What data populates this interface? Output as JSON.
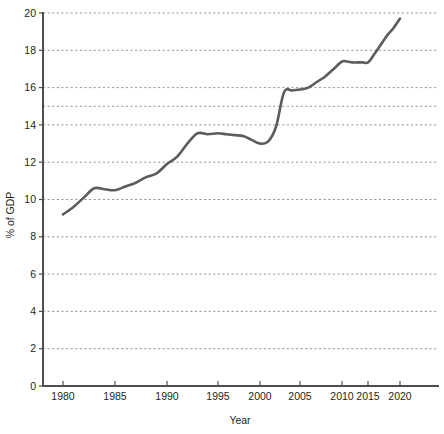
{
  "chart_data": {
    "type": "line",
    "title": "",
    "subtitle": "",
    "xlabel": "Year",
    "ylabel": "% of GDP",
    "xlim": [
      1979,
      2022
    ],
    "ylim": [
      0,
      20
    ],
    "grid": true,
    "legend": false,
    "legend_position": "none",
    "line_color": "#5c5c5c",
    "grid_color": "#8c8c8c",
    "axis_color": "#4d4d4d",
    "x_tick_labels": [
      "1980",
      "1985",
      "1990",
      "1995",
      "2000",
      "2005",
      "2010",
      "2015",
      "2020"
    ],
    "x_ticks": [
      1980,
      1985,
      1990,
      1995,
      2000,
      2005,
      2010,
      2015,
      2020
    ],
    "y_tick_labels": [
      "0",
      "2",
      "4",
      "6",
      "8",
      "10",
      "12",
      "14",
      "16",
      "18",
      "20"
    ],
    "y_ticks": [
      0,
      2,
      4,
      6,
      8,
      10,
      12,
      14,
      16,
      18,
      20
    ],
    "y_gridlines": [
      2,
      4,
      6,
      8,
      10,
      12,
      14,
      15,
      16,
      18,
      20
    ],
    "series": [
      {
        "name": "Health expenditure",
        "x": [
          1980,
          1981,
          1982,
          1983,
          1984,
          1985,
          1986,
          1987,
          1988,
          1989,
          1990,
          1991,
          1992,
          1993,
          1994,
          1995,
          1996,
          1997,
          1998,
          1999,
          2000,
          2001,
          2002,
          2003,
          2004,
          2005,
          2006,
          2007,
          2008,
          2009,
          2010,
          2011,
          2012,
          2013,
          2014,
          2015,
          2016,
          2017,
          2018,
          2019,
          2020
        ],
        "values": [
          9.2,
          9.6,
          10.1,
          10.6,
          10.55,
          10.5,
          10.7,
          10.9,
          11.2,
          11.4,
          11.9,
          12.3,
          13.0,
          13.55,
          13.5,
          13.55,
          13.5,
          13.45,
          13.4,
          13.2,
          13.0,
          13.1,
          13.9,
          15.75,
          15.85,
          15.9,
          16.0,
          16.3,
          16.6,
          17.0,
          17.4,
          17.4,
          17.35,
          17.35,
          17.35,
          17.35,
          17.8,
          18.3,
          18.8,
          19.2,
          19.7
        ]
      }
    ]
  },
  "axis_titles": {
    "x": "Year",
    "y": "% of GDP"
  }
}
